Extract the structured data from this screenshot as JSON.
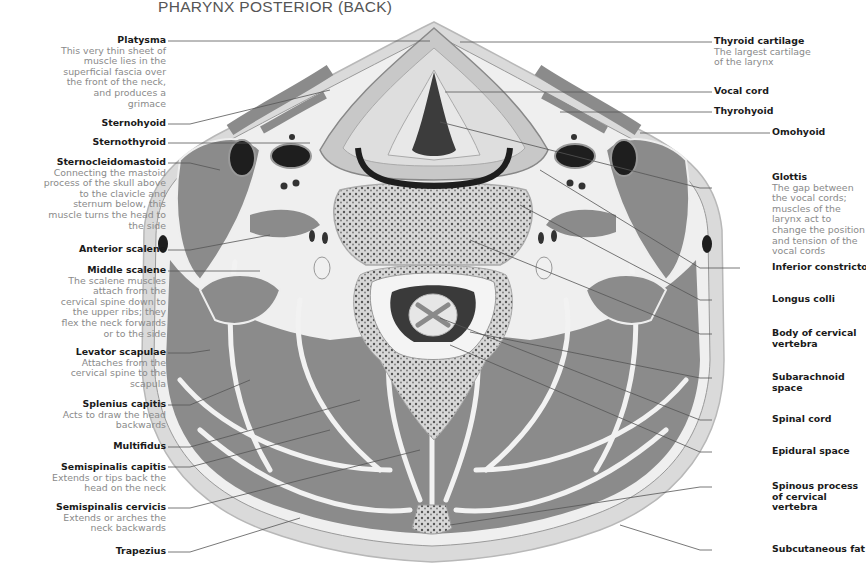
{
  "title": "PHARYNX POSTERIOR (BACK)",
  "colors": {
    "muscle": "#8b8b8b",
    "fat": "#dcdcdc",
    "fascia": "#efefef",
    "bone": "#bdbdbd",
    "dark": "#2a2a2a",
    "leader": "#555555",
    "label_name": "#1a1a1a",
    "label_desc": "#8a8a8a"
  },
  "left_labels": [
    {
      "name": "Platysma",
      "desc": "This very thin sheet of muscle lies in the superficial fascia over the front of the neck, and produces a grimace"
    },
    {
      "name": "Sternohyoid",
      "desc": ""
    },
    {
      "name": "Sternothyroid",
      "desc": ""
    },
    {
      "name": "Sternocleidomastoid",
      "desc": "Connecting the mastoid process of the skull above to the clavicle and sternum below, this muscle turns the head to the side"
    },
    {
      "name": "Anterior scalene",
      "desc": ""
    },
    {
      "name": "Middle scalene",
      "desc": "The scalene muscles attach from the cervical spine down to the upper ribs; they flex the neck forwards or to the side"
    },
    {
      "name": "Levator scapulae",
      "desc": "Attaches from the cervical spine to the scapula"
    },
    {
      "name": "Splenius capitis",
      "desc": "Acts to draw the head backwards"
    },
    {
      "name": "Multifidus",
      "desc": ""
    },
    {
      "name": "Semispinalis capitis",
      "desc": "Extends or tips back the head on the neck"
    },
    {
      "name": "Semispinalis cervicis",
      "desc": "Extends or arches the neck backwards"
    },
    {
      "name": "Trapezius",
      "desc": ""
    }
  ],
  "right_labels": [
    {
      "name": "Thyroid cartilage",
      "desc": "The largest cartilage of the larynx"
    },
    {
      "name": "Vocal cord",
      "desc": ""
    },
    {
      "name": "Thyrohyoid",
      "desc": ""
    },
    {
      "name": "Omohyoid",
      "desc": ""
    },
    {
      "name": "Glottis",
      "desc": "The gap between the vocal cords; muscles of the larynx act to change the position and tension of the vocal cords"
    },
    {
      "name": "Inferior constrictor",
      "desc": ""
    },
    {
      "name": "Longus colli",
      "desc": ""
    },
    {
      "name": "Body of cervical vertebra",
      "desc": ""
    },
    {
      "name": "Subarachnoid space",
      "desc": ""
    },
    {
      "name": "Spinal cord",
      "desc": ""
    },
    {
      "name": "Epidural space",
      "desc": ""
    },
    {
      "name": "Spinous process of cervical vertebra",
      "desc": ""
    },
    {
      "name": "Subcutaneous fat",
      "desc": ""
    }
  ]
}
